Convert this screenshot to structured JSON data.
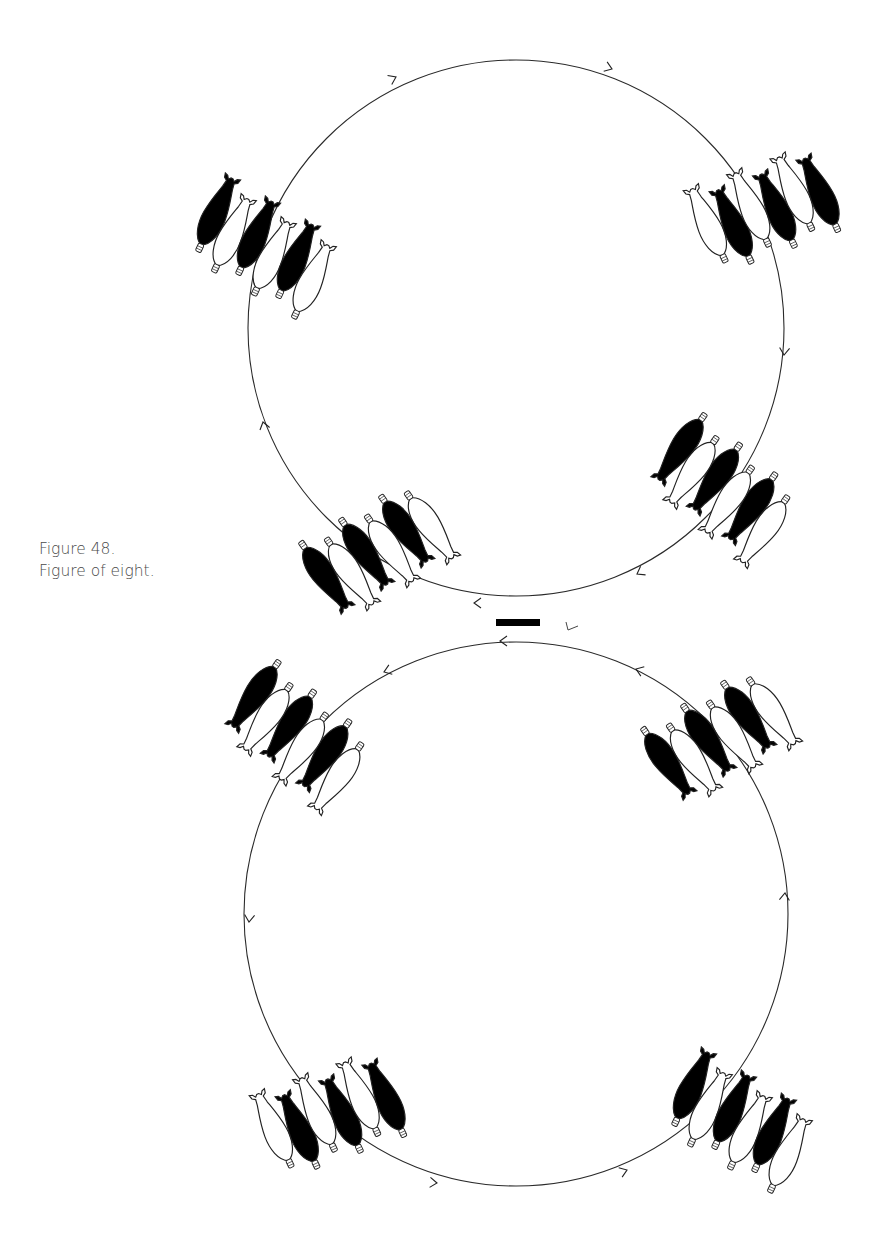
{
  "caption": {
    "number": "Figure 48.",
    "title": "Figure of eight."
  },
  "figure": {
    "colors": {
      "stroke": "#222222",
      "fill_dark": "#000000",
      "fill_light": "#ffffff",
      "marker": "#000000"
    },
    "circles": [
      {
        "name": "top-circle",
        "cx": 516,
        "cy": 328,
        "r": 268,
        "direction": "clockwise"
      },
      {
        "name": "bottom-circle",
        "cx": 516,
        "cy": 914,
        "r": 272,
        "direction": "counterclockwise"
      }
    ],
    "arrows": [
      {
        "circle": "top-circle",
        "x": 396,
        "y": 77,
        "angle": -25
      },
      {
        "circle": "top-circle",
        "x": 612,
        "y": 69,
        "angle": 20
      },
      {
        "circle": "top-circle",
        "x": 784,
        "y": 355,
        "angle": 95
      },
      {
        "circle": "top-circle",
        "x": 637,
        "y": 574,
        "angle": 150
      },
      {
        "circle": "top-circle",
        "x": 474,
        "y": 603,
        "angle": 180
      },
      {
        "circle": "top-circle",
        "x": 263,
        "y": 422,
        "angle": -105
      },
      {
        "circle": "bottom-circle",
        "x": 500,
        "y": 641,
        "angle": 180
      },
      {
        "circle": "bottom-circle",
        "x": 636,
        "y": 669,
        "angle": 200
      },
      {
        "circle": "bottom-circle",
        "x": 384,
        "y": 672,
        "angle": 160
      },
      {
        "circle": "bottom-circle",
        "x": 249,
        "y": 922,
        "angle": 95
      },
      {
        "circle": "bottom-circle",
        "x": 437,
        "y": 1183,
        "angle": 5
      },
      {
        "circle": "bottom-circle",
        "x": 627,
        "y": 1170,
        "angle": -20
      },
      {
        "circle": "bottom-circle",
        "x": 785,
        "y": 893,
        "angle": -85
      }
    ],
    "bomb_groups": [
      {
        "name": "top-left-group",
        "x": 264,
        "y": 246,
        "rotation": 25,
        "pattern": [
          "dark",
          "light",
          "dark",
          "light",
          "dark",
          "light"
        ]
      },
      {
        "name": "top-right-group",
        "x": 764,
        "y": 208,
        "rotation": -25,
        "pattern": [
          "light",
          "dark",
          "light",
          "dark",
          "light",
          "dark"
        ]
      },
      {
        "name": "mid-right-group",
        "x": 722,
        "y": 490,
        "rotation": 215,
        "pattern": [
          "light",
          "dark",
          "light",
          "dark",
          "light",
          "dark"
        ]
      },
      {
        "name": "mid-left-group",
        "x": 378,
        "y": 552,
        "rotation": 145,
        "pattern": [
          "light",
          "dark",
          "light",
          "dark",
          "light",
          "dark"
        ]
      },
      {
        "name": "lower-left-top-group",
        "x": 296,
        "y": 737,
        "rotation": 215,
        "pattern": [
          "light",
          "dark",
          "light",
          "dark",
          "light",
          "dark"
        ]
      },
      {
        "name": "lower-right-top-group",
        "x": 720,
        "y": 738,
        "rotation": 145,
        "pattern": [
          "light",
          "dark",
          "light",
          "dark",
          "light",
          "dark"
        ]
      },
      {
        "name": "lower-left-bottom-group",
        "x": 330,
        "y": 1113,
        "rotation": -25,
        "pattern": [
          "light",
          "dark",
          "light",
          "dark",
          "light",
          "dark"
        ]
      },
      {
        "name": "lower-right-bottom-group",
        "x": 740,
        "y": 1120,
        "rotation": 25,
        "pattern": [
          "dark",
          "light",
          "dark",
          "light",
          "dark",
          "light"
        ]
      }
    ],
    "center_marker": {
      "x": 496,
      "y": 619,
      "width": 44,
      "height": 7
    },
    "tick_mark": {
      "x": 568,
      "y": 626
    }
  }
}
